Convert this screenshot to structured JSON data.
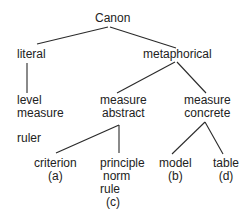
{
  "diagram": {
    "type": "tree",
    "root": {
      "label": "Canon",
      "children": [
        {
          "label": "literal",
          "children": [
            {
              "lines": [
                "level",
                "measure"
              ],
              "extra": "ruler"
            }
          ]
        },
        {
          "label": "metaphorical",
          "children": [
            {
              "lines": [
                "measure",
                "abstract"
              ],
              "children": [
                {
                  "lines": [
                    "criterion",
                    "(a)"
                  ]
                },
                {
                  "lines": [
                    "principle",
                    "norm",
                    "rule",
                    "(c)"
                  ]
                }
              ]
            },
            {
              "lines": [
                "measure",
                "concrete"
              ],
              "children": [
                {
                  "lines": [
                    "model",
                    "(b)"
                  ]
                },
                {
                  "lines": [
                    "table",
                    "(d)"
                  ]
                }
              ]
            }
          ]
        }
      ]
    }
  },
  "nodes": {
    "canon": "Canon",
    "literal": "literal",
    "metaphorical": "metaphorical",
    "level": "level",
    "level_measure": "measure",
    "ruler": "ruler",
    "abstract_measure": "measure",
    "abstract": "abstract",
    "concrete_measure": "measure",
    "concrete": "concrete",
    "criterion": "criterion",
    "criterion_tag": "(a)",
    "principle": "principle",
    "norm": "norm",
    "rule": "rule",
    "principle_tag": "(c)",
    "model": "model",
    "model_tag": "(b)",
    "table": "table",
    "table_tag": "(d)"
  },
  "colors": {
    "line": "#2a2a2a",
    "text": "#222222",
    "background": "#ffffff"
  }
}
